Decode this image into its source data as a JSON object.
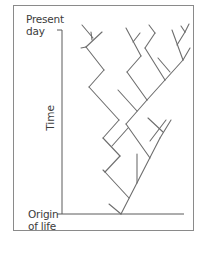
{
  "diagram": {
    "labels": {
      "top_line1": "Present",
      "top_line2": "day",
      "axis": "Time",
      "bottom_line1": "Origin",
      "bottom_line2": "of life"
    },
    "colors": {
      "line": "#6e6e6e",
      "axis": "#5a5a5a",
      "frame": "#8a8a8a",
      "text": "#3c3c3c"
    },
    "axis": {
      "vertical": {
        "x": 62,
        "y1": 30,
        "y2": 214
      },
      "top_tick": {
        "x1": 57,
        "x2": 62,
        "y": 30
      },
      "baseline": {
        "x1": 57,
        "x2": 184,
        "y": 214
      }
    },
    "tree_segments": [
      [
        121,
        214,
        160,
        138
      ],
      [
        121,
        214,
        109,
        204
      ],
      [
        129,
        198,
        105,
        172
      ],
      [
        137,
        183,
        137,
        154
      ],
      [
        150,
        158,
        126,
        124
      ],
      [
        126,
        124,
        147,
        100
      ],
      [
        137,
        111,
        118,
        90
      ],
      [
        150,
        141,
        166,
        120
      ],
      [
        160,
        138,
        171,
        120
      ],
      [
        163,
        132,
        148,
        118
      ],
      [
        105,
        172,
        120,
        156
      ],
      [
        105,
        172,
        103,
        170
      ],
      [
        120,
        156,
        103,
        138
      ],
      [
        112,
        146,
        128,
        128
      ],
      [
        103,
        138,
        119,
        120
      ],
      [
        119,
        120,
        89,
        87
      ],
      [
        89,
        87,
        104,
        70
      ],
      [
        104,
        70,
        86,
        47
      ],
      [
        86,
        47,
        102,
        32
      ],
      [
        86,
        47,
        81,
        48
      ],
      [
        92,
        40,
        91,
        32
      ],
      [
        93,
        38,
        82,
        25
      ],
      [
        147,
        100,
        127,
        72
      ],
      [
        127,
        72,
        141,
        56
      ],
      [
        141,
        56,
        126,
        28
      ],
      [
        133,
        42,
        140,
        33
      ],
      [
        147,
        100,
        165,
        80
      ],
      [
        165,
        80,
        145,
        48
      ],
      [
        145,
        48,
        155,
        33
      ],
      [
        155,
        33,
        149,
        25
      ],
      [
        165,
        80,
        183,
        60
      ],
      [
        170,
        72,
        158,
        58
      ],
      [
        183,
        60,
        172,
        30
      ],
      [
        177,
        45,
        185,
        32
      ],
      [
        183,
        60,
        190,
        48
      ],
      [
        185,
        32,
        181,
        26
      ],
      [
        185,
        32,
        189,
        24
      ]
    ]
  }
}
